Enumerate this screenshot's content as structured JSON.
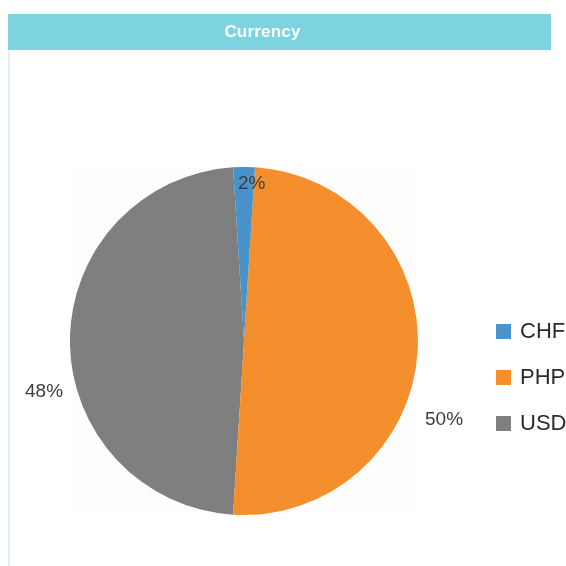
{
  "header": {
    "title": "Currency",
    "bar_color": "#7dd3e0",
    "text_color": "#ffffff"
  },
  "legend": {
    "position": "right",
    "items": [
      {
        "label": "CHF",
        "color": "#4a93cc",
        "swatch_name": "legend-swatch-chf"
      },
      {
        "label": "PHP",
        "color": "#f6902d",
        "swatch_name": "legend-swatch-php"
      },
      {
        "label": "USD",
        "color": "#7f7f7f",
        "swatch_name": "legend-swatch-usd"
      }
    ]
  },
  "labels": {
    "top": "2%",
    "left": "48%",
    "right": "50%"
  },
  "chart_data": {
    "type": "pie",
    "title": "Currency",
    "categories": [
      "CHF",
      "PHP",
      "USD"
    ],
    "values": [
      2,
      50,
      48
    ],
    "value_labels": [
      "2%",
      "50%",
      "48%"
    ],
    "colors": [
      "#4a93cc",
      "#f6902d",
      "#7f7f7f"
    ],
    "units": "percent",
    "start_angle_deg": -3.6,
    "direction": "clockwise",
    "legend_position": "right",
    "grid": false,
    "xlabel": "",
    "ylabel": ""
  }
}
